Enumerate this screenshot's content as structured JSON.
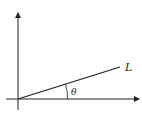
{
  "diagram": {
    "line_label": "L",
    "angle_label": "θ",
    "colors": {
      "stroke": "#222222",
      "background": "#ffffff"
    }
  }
}
